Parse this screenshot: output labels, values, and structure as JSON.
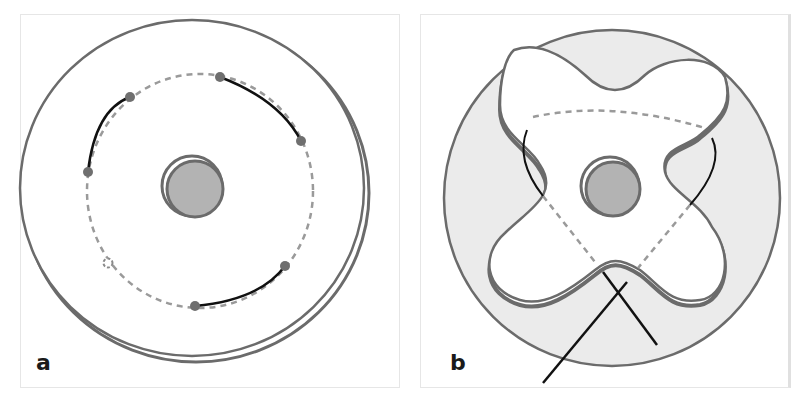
{
  "figure": {
    "panels": [
      {
        "id": "a",
        "label": "a",
        "description": "Circular outer ring with central round element; dashed circular path with five arcs (solid segments) joined by small round markers"
      },
      {
        "id": "b",
        "label": "b",
        "description": "Gray filled disk with a four-lobed white cut-out, central round element, dashed polygonal path and two crossing solid lines below"
      }
    ]
  },
  "colors": {
    "outline": "#6b6b6b",
    "fill_gray": "#ebebeb",
    "center_fill": "#b3b3b3",
    "dashed": "#9a9a9a",
    "solid_line": "#111111",
    "marker": "#6f6f6f",
    "label": "#1a1a1a"
  }
}
